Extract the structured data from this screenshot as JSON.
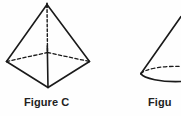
{
  "page": {
    "background_color": "#fefefe",
    "width": 181,
    "height": 116
  },
  "figures": [
    {
      "id": "figure-c",
      "shape": "square-based-pyramid",
      "caption": "Figure C",
      "stroke_color": "#1a1a1a",
      "hidden_edge_style": "dashed",
      "vertices": {
        "apex": [
          47,
          4
        ],
        "left": [
          6,
          62
        ],
        "right": [
          90,
          62
        ],
        "front": [
          48,
          88
        ],
        "back": [
          48,
          52
        ]
      }
    },
    {
      "id": "figure-d",
      "shape": "cone",
      "caption": "Figure D",
      "caption_visible_text": "Figu",
      "stroke_color": "#1a1a1a",
      "hidden_edge_style": "dashed",
      "base_ellipse_center": [
        176,
        74
      ],
      "cropped": true
    }
  ],
  "captions": {
    "figure_c": "Figure C",
    "figure_d": "Figu"
  },
  "colors": {
    "ink": "#1a1a1a",
    "text": "#222222",
    "background": "#fefefe"
  }
}
